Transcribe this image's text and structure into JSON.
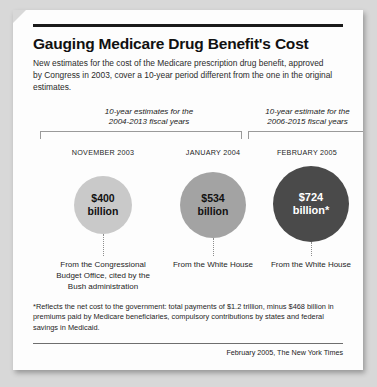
{
  "header": {
    "title": "Gauging Medicare Drug Benefit's Cost",
    "subtitle": "New estimates for the cost of the Medicare prescription drug benefit, approved by Congress in 2003, cover a 10-year period different from the one in the original estimates."
  },
  "groups": [
    {
      "label_line1": "10-year estimates for the",
      "label_line2": "2004-2013 fiscal years"
    },
    {
      "label_line1": "10-year estimate for the",
      "label_line2": "2006-2015 fiscal years"
    }
  ],
  "estimates": [
    {
      "date": "NOVEMBER 2003",
      "amount": "$400",
      "unit": "billion",
      "caption": "From the Congressional Budget Office, cited by the Bush administration",
      "color": "#c9c9c9",
      "text_color": "#111111"
    },
    {
      "date": "JANUARY 2004",
      "amount": "$534",
      "unit": "billion",
      "caption": "From the White House",
      "color": "#a3a3a3",
      "text_color": "#111111"
    },
    {
      "date": "FEBRUARY 2005",
      "amount": "$724",
      "unit": "billion*",
      "caption": "From the White House",
      "color": "#4a4a4a",
      "text_color": "#ffffff"
    }
  ],
  "footnote": "*Reflects the net cost to the government: total payments of $1.2 trillion, minus $468 billion in premiums paid by Medicare beneficiaries, compulsory contributions by states and federal savings in Medicaid.",
  "source": "February 2005, The New York Times",
  "chart_data": {
    "type": "bar",
    "title": "Gauging Medicare Drug Benefit's Cost",
    "subtitle": "New estimates for the cost of the Medicare prescription drug benefit, approved by Congress in 2003, cover a 10-year period different from the one in the original estimates.",
    "categories": [
      "NOVEMBER 2003",
      "JANUARY 2004",
      "FEBRUARY 2005"
    ],
    "values": [
      400,
      534,
      724
    ],
    "value_labels": [
      "$400 billion",
      "$534 billion",
      "$724 billion*"
    ],
    "series": [
      {
        "name": "10-year Medicare drug benefit cost estimate (billions of dollars)",
        "values": [
          400,
          534,
          724
        ]
      }
    ],
    "annotations": [
      "From the Congressional Budget Office, cited by the Bush administration",
      "From the White House",
      "From the White House"
    ],
    "groupings": [
      {
        "label": "10-year estimates for the 2004-2013 fiscal years",
        "categories": [
          "NOVEMBER 2003",
          "JANUARY 2004"
        ]
      },
      {
        "label": "10-year estimate for the 2006-2015 fiscal years",
        "categories": [
          "FEBRUARY 2005"
        ]
      }
    ],
    "xlabel": "",
    "ylabel": "Cost estimate (billions of dollars)",
    "ylim": [
      0,
      800
    ],
    "grid": false,
    "legend": "none",
    "note": "Rendered as proportionally sized circles, not bars; circle area scales with value.",
    "footnote": "*Reflects the net cost to the government: total payments of $1.2 trillion, minus $468 billion in premiums paid by Medicare beneficiaries, compulsory contributions by states and federal savings in Medicaid.",
    "source": "February 2005, The New York Times"
  }
}
